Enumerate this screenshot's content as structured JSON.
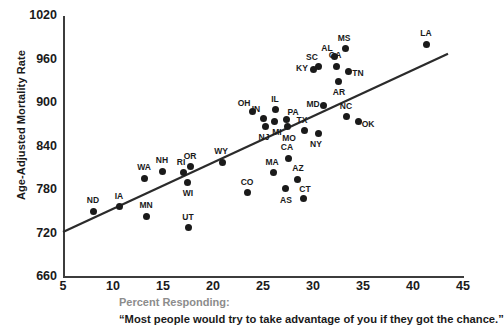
{
  "chart_data": {
    "type": "scatter",
    "title": "",
    "xlabel": "Percent Responding:",
    "ylabel": "Age-Adjusted Mortality Rate",
    "xlim": [
      5,
      45
    ],
    "ylim": [
      660,
      1020
    ],
    "xticks": [
      "5",
      "10",
      "15",
      "20",
      "25",
      "30",
      "35",
      "40",
      "45"
    ],
    "yticks": [
      "1020",
      "960",
      "900",
      "840",
      "780",
      "720",
      "660"
    ],
    "grid": false,
    "legend": "none",
    "point_color": "#1a1a1a",
    "trendline": {
      "x0": 5,
      "y0": 722,
      "x1": 43.5,
      "y1": 968
    },
    "points": [
      {
        "label": "ND",
        "x": 8.0,
        "y": 751
      },
      {
        "label": "IA",
        "x": 10.6,
        "y": 757
      },
      {
        "label": "MN",
        "x": 13.3,
        "y": 744
      },
      {
        "label": "WA",
        "x": 13.1,
        "y": 796
      },
      {
        "label": "NH",
        "x": 14.9,
        "y": 806
      },
      {
        "label": "RI",
        "x": 17.0,
        "y": 804
      },
      {
        "label": "WI",
        "x": 17.4,
        "y": 791
      },
      {
        "label": "OR",
        "x": 17.7,
        "y": 812
      },
      {
        "label": "UT",
        "x": 17.5,
        "y": 728
      },
      {
        "label": "WY",
        "x": 20.9,
        "y": 818
      },
      {
        "label": "CO",
        "x": 23.4,
        "y": 776
      },
      {
        "label": "OH",
        "x": 23.9,
        "y": 888
      },
      {
        "label": "IN",
        "x": 25.0,
        "y": 879
      },
      {
        "label": "NJ",
        "x": 25.2,
        "y": 868
      },
      {
        "label": "IL",
        "x": 26.2,
        "y": 891
      },
      {
        "label": "MI",
        "x": 26.1,
        "y": 874
      },
      {
        "label": "MA",
        "x": 26.0,
        "y": 804
      },
      {
        "label": "PA",
        "x": 27.3,
        "y": 877
      },
      {
        "label": "MO",
        "x": 27.4,
        "y": 867
      },
      {
        "label": "CA",
        "x": 27.5,
        "y": 824
      },
      {
        "label": "AS",
        "x": 27.2,
        "y": 782
      },
      {
        "label": "AZ",
        "x": 28.4,
        "y": 795
      },
      {
        "label": "CT",
        "x": 29.0,
        "y": 768
      },
      {
        "label": "TX",
        "x": 29.1,
        "y": 862
      },
      {
        "label": "KY",
        "x": 30.0,
        "y": 946
      },
      {
        "label": "NY",
        "x": 30.5,
        "y": 858
      },
      {
        "label": "SC",
        "x": 30.5,
        "y": 950
      },
      {
        "label": "MD",
        "x": 31.0,
        "y": 897
      },
      {
        "label": "AL",
        "x": 32.1,
        "y": 964
      },
      {
        "label": "GA",
        "x": 32.3,
        "y": 951
      },
      {
        "label": "AR",
        "x": 32.5,
        "y": 930
      },
      {
        "label": "MS",
        "x": 33.2,
        "y": 975
      },
      {
        "label": "NC",
        "x": 33.3,
        "y": 881
      },
      {
        "label": "TN",
        "x": 33.5,
        "y": 943
      },
      {
        "label": "OK",
        "x": 34.5,
        "y": 874
      },
      {
        "label": "LA",
        "x": 41.3,
        "y": 981
      }
    ]
  },
  "caption": {
    "line1": "Percent Responding:",
    "line2": "“Most people would try to take advantage of you if they got the chance.”"
  }
}
